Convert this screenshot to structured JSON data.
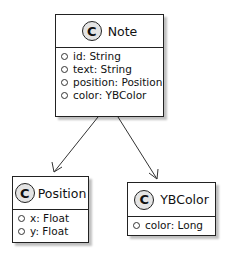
{
  "classes": {
    "note": {
      "stereotype": "C",
      "name": "Note",
      "attributes": [
        "id: String",
        "text: String",
        "position: Position",
        "color: YBColor"
      ]
    },
    "position": {
      "stereotype": "C",
      "name": "Position",
      "attributes": [
        "x: Float",
        "y: Float"
      ]
    },
    "ybcolor": {
      "stereotype": "C",
      "name": "YBColor",
      "attributes": [
        "color: Long"
      ]
    }
  },
  "edges": [
    {
      "from": "Note",
      "to": "Position"
    },
    {
      "from": "Note",
      "to": "YBColor"
    }
  ]
}
